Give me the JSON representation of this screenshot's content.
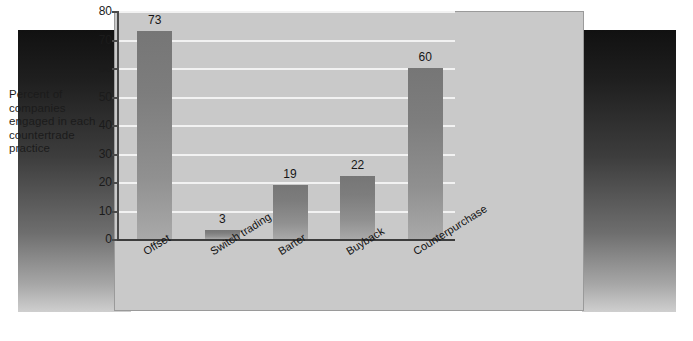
{
  "figure": {
    "caption": "Percent of\ncompanies\nengaged in each\ncountertrade\npractice",
    "caption_lines": [
      "Percent of",
      "companies",
      "engaged in each",
      "countertrade",
      "practice"
    ],
    "panel_color": "#c9c9c9",
    "bar_color": "#858585",
    "gridline_color": "#f2f2f2",
    "backdrop_top_color": "#111111",
    "backdrop_bottom_color": "#cfcfcf"
  },
  "chart_data": {
    "type": "bar",
    "title": "",
    "subtitle": "",
    "xlabel": "",
    "ylabel": "Percent of companies engaged in each countertrade practice",
    "categories": [
      "Offset",
      "Switch trading",
      "Barter",
      "Buyback",
      "Counterpurchase"
    ],
    "values": [
      73,
      3,
      19,
      22,
      60
    ],
    "data_labels": [
      "73",
      "3",
      "19",
      "22",
      "60"
    ],
    "ylim": [
      0,
      80
    ],
    "yticks": [
      0,
      10,
      20,
      30,
      40,
      50,
      60,
      70,
      80
    ],
    "ytick_labels": [
      "0",
      "10",
      "20",
      "30",
      "40",
      "50",
      "60",
      "70",
      "80"
    ],
    "grid": true,
    "grid_axis": "y",
    "legend": false,
    "legend_position": "none",
    "series": [
      {
        "name": "Percent of companies",
        "values": [
          73,
          3,
          19,
          22,
          60
        ]
      }
    ]
  }
}
